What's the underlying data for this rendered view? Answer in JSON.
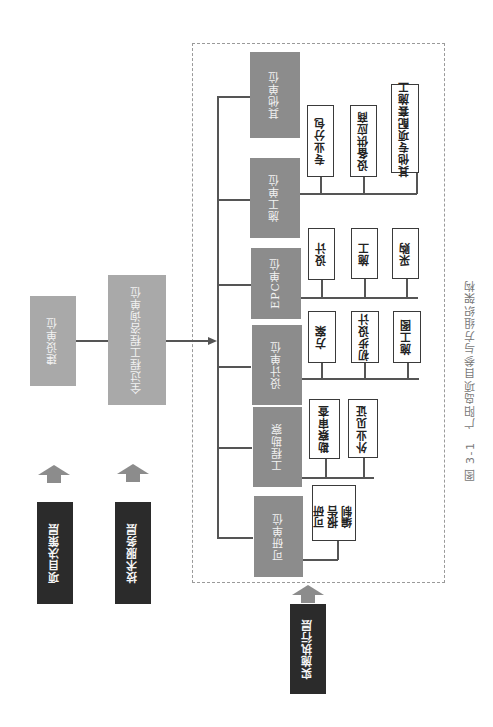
{
  "caption": "图 3-1　广阳岛项目参与方组织架构",
  "layers": {
    "decision": {
      "label": "项目决策层"
    },
    "technical": {
      "label": "技术服务层"
    },
    "execution": {
      "label": "实施执行层"
    }
  },
  "left_units": {
    "owner": {
      "label": "建设单位"
    },
    "consultant": {
      "label": "全过程工程咨询单位"
    }
  },
  "units": [
    {
      "label": "其他单位",
      "children": []
    },
    {
      "label": "施工单位",
      "children": [
        "专业分包",
        "设备供应商",
        "其他专项配套施工"
      ]
    },
    {
      "label": "EPC单位",
      "children": [
        "设计",
        "施工",
        "采购"
      ]
    },
    {
      "label": "设计单位",
      "children": [
        "方案",
        "初步设计",
        "施工图"
      ]
    },
    {
      "label": "工程勘察",
      "children": [
        "勘察审查",
        "外业见证"
      ]
    },
    {
      "label": "可研单位",
      "children": [
        "可研报告编制"
      ]
    }
  ],
  "colors": {
    "unit_gray": "#8c8c8c",
    "left_gray": "#a9a9a9",
    "layer_dark": "#2b2b2b",
    "line": "#555555",
    "dashed_border": "#9a9a9a"
  }
}
